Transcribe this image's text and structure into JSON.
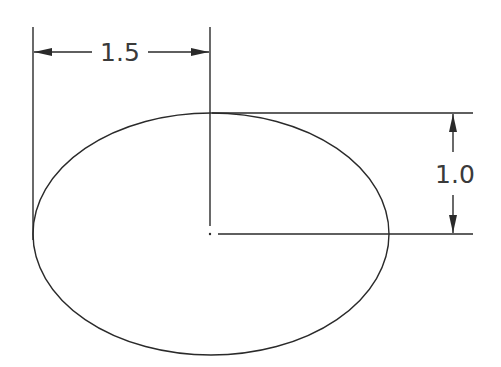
{
  "diagram": {
    "shape": "ellipse",
    "center": {
      "x": 211,
      "y": 234
    },
    "radius_x": 178,
    "radius_y": 121,
    "stroke_color": "#2a2a2a",
    "dimensions": {
      "horizontal": {
        "label": "1.5",
        "description": "semi-major axis (center to left edge)"
      },
      "vertical": {
        "label": "1.0",
        "description": "semi-minor axis (center to top edge)"
      }
    }
  }
}
